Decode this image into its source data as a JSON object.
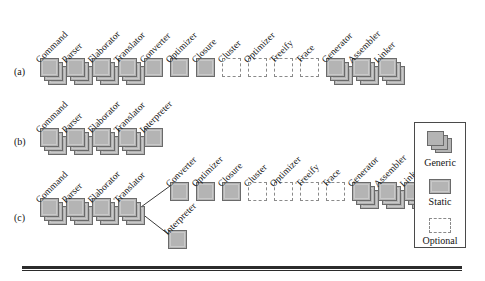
{
  "figure": {
    "bottom_rule": true
  },
  "rows": [
    {
      "id": "a",
      "label": "(a)",
      "label_x": 14,
      "label_y": 66,
      "baseline_y": 58,
      "start_x": 40,
      "pitch": 26,
      "nodes": [
        {
          "name": "Command",
          "kind": "generic"
        },
        {
          "name": "Parser",
          "kind": "generic"
        },
        {
          "name": "Elaborator",
          "kind": "generic"
        },
        {
          "name": "Translator",
          "kind": "generic"
        },
        {
          "name": "Converter",
          "kind": "static"
        },
        {
          "name": "Optimizer",
          "kind": "static"
        },
        {
          "name": "Closure",
          "kind": "static"
        },
        {
          "name": "Cluster",
          "kind": "optional"
        },
        {
          "name": "Optimizer",
          "kind": "optional"
        },
        {
          "name": "Treeify",
          "kind": "optional"
        },
        {
          "name": "Trace",
          "kind": "optional"
        },
        {
          "name": "Generator",
          "kind": "generic"
        },
        {
          "name": "Assembler",
          "kind": "generic"
        },
        {
          "name": "Linker",
          "kind": "generic"
        }
      ]
    },
    {
      "id": "b",
      "label": "(b)",
      "label_x": 14,
      "label_y": 136,
      "baseline_y": 128,
      "start_x": 40,
      "pitch": 26,
      "nodes": [
        {
          "name": "Command",
          "kind": "generic"
        },
        {
          "name": "Parser",
          "kind": "generic"
        },
        {
          "name": "Elaborator",
          "kind": "generic"
        },
        {
          "name": "Translator",
          "kind": "generic"
        },
        {
          "name": "Interpreter",
          "kind": "static"
        }
      ]
    },
    {
      "id": "c",
      "label": "(c)",
      "label_x": 14,
      "label_y": 212,
      "baseline_y": 198,
      "start_x": 40,
      "pitch": 26,
      "nodes": [
        {
          "name": "Command",
          "kind": "generic"
        },
        {
          "name": "Parser",
          "kind": "generic"
        },
        {
          "name": "Elaborator",
          "kind": "generic"
        },
        {
          "name": "Translator",
          "kind": "generic"
        }
      ],
      "upper_branch": {
        "start_x": 170,
        "baseline_y": 182,
        "pitch": 26,
        "nodes": [
          {
            "name": "Converter",
            "kind": "static"
          },
          {
            "name": "Optimizer",
            "kind": "static"
          },
          {
            "name": "Closure",
            "kind": "static"
          },
          {
            "name": "Cluster",
            "kind": "optional"
          },
          {
            "name": "Optimizer",
            "kind": "optional"
          },
          {
            "name": "Treeify",
            "kind": "optional"
          },
          {
            "name": "Trace",
            "kind": "optional"
          },
          {
            "name": "Generator",
            "kind": "generic"
          },
          {
            "name": "Assembler",
            "kind": "generic"
          },
          {
            "name": "Linker",
            "kind": "generic"
          }
        ]
      },
      "lower_branch": {
        "start_x": 168,
        "baseline_y": 230,
        "nodes": [
          {
            "name": "Interpreter",
            "kind": "static"
          }
        ]
      },
      "connectors": [
        {
          "from": "translator-out",
          "to": "converter-in"
        },
        {
          "from": "translator-out",
          "to": "interpreter-in"
        }
      ]
    }
  ],
  "legend": {
    "x": 414,
    "y": 122,
    "width": 52,
    "height": 126,
    "items": [
      {
        "key": "generic",
        "label": "Generic"
      },
      {
        "key": "static",
        "label": "Static"
      },
      {
        "key": "optional",
        "label": "Optional"
      }
    ]
  },
  "colors": {
    "box_fill": "#b4b4b4",
    "box_border": "#6a6a6a",
    "box_inner_highlight": "#c9c9c9",
    "optional_border": "#8a8a8a",
    "text": "#141414",
    "rule": "#2b2b2b",
    "background": "#ffffff"
  }
}
